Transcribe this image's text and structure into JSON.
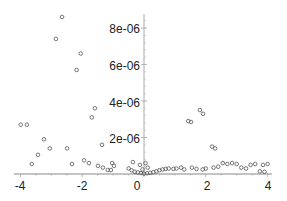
{
  "chart_data": {
    "type": "scatter",
    "title": "",
    "xlabel": "",
    "ylabel": "",
    "xlim": [
      -4.1,
      4.1
    ],
    "ylim": [
      0,
      8.6e-06
    ],
    "grid": false,
    "legend": null,
    "x_ticks": [
      {
        "value": -4,
        "label": "-4"
      },
      {
        "value": -2,
        "label": "-2"
      },
      {
        "value": 0,
        "label": "0"
      },
      {
        "value": 2,
        "label": "2"
      },
      {
        "value": 4,
        "label": "4"
      }
    ],
    "y_ticks": [
      {
        "value": 2e-06,
        "label": "2e-06"
      },
      {
        "value": 4e-06,
        "label": "4e-06"
      },
      {
        "value": 6e-06,
        "label": "6e-06"
      },
      {
        "value": 8e-06,
        "label": "8e-06"
      }
    ],
    "marker": {
      "shape": "circle-open",
      "color": "#555555"
    },
    "series": [
      {
        "name": "points",
        "points": [
          [
            -2.65,
            8.6e-06
          ],
          [
            -2.85,
            7.4e-06
          ],
          [
            -2.05,
            6.6e-06
          ],
          [
            -2.18,
            5.7e-06
          ],
          [
            -1.59,
            3.6e-06
          ],
          [
            -1.69,
            3.1e-06
          ],
          [
            -1.36,
            1.6e-06
          ],
          [
            -3.99,
            2.7e-06
          ],
          [
            -3.79,
            2.7e-06
          ],
          [
            -3.24,
            1.9e-06
          ],
          [
            -3.05,
            1.4e-06
          ],
          [
            -3.43,
            1.05e-06
          ],
          [
            -3.63,
            5.5e-07
          ],
          [
            -2.49,
            1.4e-06
          ],
          [
            -2.33,
            5.5e-07
          ],
          [
            -1.94,
            7.5e-07
          ],
          [
            -1.78,
            6e-07
          ],
          [
            -1.49,
            4.5e-07
          ],
          [
            -1.33,
            3.5e-07
          ],
          [
            -1.17,
            2.2e-07
          ],
          [
            -1.07,
            2.2e-07
          ],
          [
            -0.97,
            4.5e-07
          ],
          [
            -1.03,
            6e-07
          ],
          [
            -0.36,
            6.5e-07
          ],
          [
            -0.13,
            5e-07
          ],
          [
            -0.5,
            3e-07
          ],
          [
            -0.4,
            2e-07
          ],
          [
            -0.3,
            1.2e-07
          ],
          [
            -0.2,
            8e-08
          ],
          [
            -0.1,
            5e-08
          ],
          [
            0.0,
            2e-08
          ],
          [
            0.1,
            4e-08
          ],
          [
            0.2,
            6e-08
          ],
          [
            0.3,
            1e-07
          ],
          [
            0.4,
            1.5e-07
          ],
          [
            0.5,
            2e-07
          ],
          [
            0.6,
            2.5e-07
          ],
          [
            0.7,
            2.8e-07
          ],
          [
            0.8,
            3e-07
          ],
          [
            0.95,
            2.8e-07
          ],
          [
            1.05,
            3e-07
          ],
          [
            1.2,
            3.5e-07
          ],
          [
            1.3,
            2.5e-07
          ],
          [
            0.05,
            6e-07
          ],
          [
            0.12,
            3.5e-07
          ],
          [
            -0.05,
            2.5e-07
          ],
          [
            1.81,
            3.5e-06
          ],
          [
            1.91,
            3.3e-06
          ],
          [
            1.43,
            2.9e-06
          ],
          [
            1.52,
            2.85e-06
          ],
          [
            2.2,
            1.5e-06
          ],
          [
            2.3,
            1.4e-06
          ],
          [
            1.55,
            3.5e-07
          ],
          [
            1.7,
            2.8e-07
          ],
          [
            1.9,
            2.5e-07
          ],
          [
            2.0,
            3e-07
          ],
          [
            2.25,
            3.5e-07
          ],
          [
            2.4,
            4e-07
          ],
          [
            2.55,
            6e-07
          ],
          [
            2.7,
            5.5e-07
          ],
          [
            2.85,
            6e-07
          ],
          [
            3.0,
            5.5e-07
          ],
          [
            3.15,
            3.5e-07
          ],
          [
            3.3,
            3e-07
          ],
          [
            3.45,
            5e-07
          ],
          [
            3.6,
            5.5e-07
          ],
          [
            3.75,
            1.5e-07
          ],
          [
            3.9,
            1.2e-07
          ],
          [
            3.85,
            5e-07
          ],
          [
            4.0,
            5.5e-07
          ]
        ]
      }
    ]
  },
  "axes": {
    "x_tick_labels": [
      "-4",
      "-2",
      "0",
      "2",
      "4"
    ],
    "y_tick_labels": [
      "2e-06",
      "4e-06",
      "6e-06",
      "8e-06"
    ]
  }
}
